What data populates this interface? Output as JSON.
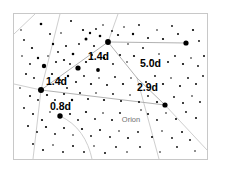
{
  "chart_data": {
    "type": "scatter",
    "title": "",
    "subtitle": "",
    "xlabel": "",
    "ylabel": "",
    "grid": false,
    "legend_position": "none",
    "xlim": [
      13,
      208
    ],
    "ylim": [
      13,
      160
    ],
    "constellation_labels": [
      {
        "name": "orion-label",
        "text": "Orion",
        "x": 131,
        "y": 122,
        "color": "#6f6f6f"
      }
    ],
    "separation_labels": [
      {
        "name": "sep-1-4-upper",
        "text": "1.4d",
        "x": 88,
        "y": 60,
        "color": "#000000"
      },
      {
        "name": "sep-5-0",
        "text": "5.0d",
        "x": 140,
        "y": 67,
        "color": "#000000"
      },
      {
        "name": "sep-1-4-left",
        "text": "1.4d",
        "x": 46,
        "y": 85,
        "color": "#000000"
      },
      {
        "name": "sep-2-9",
        "text": "2.9d",
        "x": 137,
        "y": 91,
        "color": "#000000"
      },
      {
        "name": "sep-0-8",
        "text": "0.8d",
        "x": 50,
        "y": 110,
        "color": "#000000"
      }
    ],
    "bright_stars": [
      {
        "x": 108,
        "y": 42,
        "r": 2.9
      },
      {
        "x": 186,
        "y": 43,
        "r": 2.6
      },
      {
        "x": 41,
        "y": 90,
        "r": 3.0
      },
      {
        "x": 78,
        "y": 68,
        "r": 2.6
      },
      {
        "x": 165,
        "y": 105,
        "r": 2.6
      },
      {
        "x": 60,
        "y": 116,
        "r": 2.7
      },
      {
        "x": 44,
        "y": 66,
        "r": 2.2
      },
      {
        "x": 98,
        "y": 70,
        "r": 1.9
      }
    ],
    "stars": [
      {
        "x": 41,
        "y": 24,
        "r": 1.3
      },
      {
        "x": 61,
        "y": 33,
        "r": 0.8
      },
      {
        "x": 71,
        "y": 21,
        "r": 1.0
      },
      {
        "x": 83,
        "y": 30,
        "r": 1.1
      },
      {
        "x": 86,
        "y": 39,
        "r": 1.5
      },
      {
        "x": 90,
        "y": 33,
        "r": 1.2
      },
      {
        "x": 96,
        "y": 29,
        "r": 0.9
      },
      {
        "x": 100,
        "y": 36,
        "r": 1.3
      },
      {
        "x": 103,
        "y": 25,
        "r": 0.8
      },
      {
        "x": 112,
        "y": 31,
        "r": 0.9
      },
      {
        "x": 118,
        "y": 35,
        "r": 1.1
      },
      {
        "x": 124,
        "y": 27,
        "r": 0.8
      },
      {
        "x": 133,
        "y": 34,
        "r": 1.2
      },
      {
        "x": 139,
        "y": 25,
        "r": 0.9
      },
      {
        "x": 148,
        "y": 38,
        "r": 1.0
      },
      {
        "x": 157,
        "y": 30,
        "r": 0.8
      },
      {
        "x": 163,
        "y": 39,
        "r": 1.1
      },
      {
        "x": 172,
        "y": 26,
        "r": 0.9
      },
      {
        "x": 178,
        "y": 34,
        "r": 1.0
      },
      {
        "x": 193,
        "y": 30,
        "r": 1.1
      },
      {
        "x": 199,
        "y": 41,
        "r": 0.9
      },
      {
        "x": 24,
        "y": 40,
        "r": 0.9
      },
      {
        "x": 32,
        "y": 48,
        "r": 1.1
      },
      {
        "x": 53,
        "y": 44,
        "r": 1.2
      },
      {
        "x": 58,
        "y": 52,
        "r": 0.9
      },
      {
        "x": 66,
        "y": 46,
        "r": 1.0
      },
      {
        "x": 73,
        "y": 54,
        "r": 1.3
      },
      {
        "x": 79,
        "y": 44,
        "r": 0.9
      },
      {
        "x": 64,
        "y": 60,
        "r": 1.1
      },
      {
        "x": 70,
        "y": 64,
        "r": 0.9
      },
      {
        "x": 56,
        "y": 62,
        "r": 1.0
      },
      {
        "x": 48,
        "y": 56,
        "r": 0.8
      },
      {
        "x": 38,
        "y": 58,
        "r": 1.2
      },
      {
        "x": 30,
        "y": 64,
        "r": 0.9
      },
      {
        "x": 22,
        "y": 56,
        "r": 0.8
      },
      {
        "x": 86,
        "y": 62,
        "r": 1.1
      },
      {
        "x": 92,
        "y": 55,
        "r": 0.9
      },
      {
        "x": 104,
        "y": 58,
        "r": 1.2
      },
      {
        "x": 113,
        "y": 64,
        "r": 0.9
      },
      {
        "x": 120,
        "y": 55,
        "r": 1.0
      },
      {
        "x": 127,
        "y": 62,
        "r": 0.8
      },
      {
        "x": 134,
        "y": 56,
        "r": 1.1
      },
      {
        "x": 151,
        "y": 60,
        "r": 0.9
      },
      {
        "x": 159,
        "y": 54,
        "r": 0.8
      },
      {
        "x": 168,
        "y": 62,
        "r": 1.0
      },
      {
        "x": 175,
        "y": 56,
        "r": 0.9
      },
      {
        "x": 183,
        "y": 64,
        "r": 1.1
      },
      {
        "x": 191,
        "y": 58,
        "r": 0.8
      },
      {
        "x": 198,
        "y": 66,
        "r": 0.9
      },
      {
        "x": 204,
        "y": 56,
        "r": 1.0
      },
      {
        "x": 26,
        "y": 74,
        "r": 1.0
      },
      {
        "x": 34,
        "y": 78,
        "r": 0.9
      },
      {
        "x": 52,
        "y": 74,
        "r": 1.1
      },
      {
        "x": 60,
        "y": 80,
        "r": 0.9
      },
      {
        "x": 68,
        "y": 76,
        "r": 1.2
      },
      {
        "x": 76,
        "y": 82,
        "r": 1.0
      },
      {
        "x": 84,
        "y": 76,
        "r": 0.9
      },
      {
        "x": 91,
        "y": 84,
        "r": 1.1
      },
      {
        "x": 99,
        "y": 78,
        "r": 0.8
      },
      {
        "x": 107,
        "y": 85,
        "r": 1.0
      },
      {
        "x": 115,
        "y": 77,
        "r": 0.9
      },
      {
        "x": 123,
        "y": 84,
        "r": 1.1
      },
      {
        "x": 131,
        "y": 78,
        "r": 0.8
      },
      {
        "x": 146,
        "y": 82,
        "r": 1.0
      },
      {
        "x": 155,
        "y": 76,
        "r": 0.9
      },
      {
        "x": 163,
        "y": 84,
        "r": 1.1
      },
      {
        "x": 171,
        "y": 78,
        "r": 0.8
      },
      {
        "x": 180,
        "y": 86,
        "r": 1.0
      },
      {
        "x": 188,
        "y": 78,
        "r": 0.9
      },
      {
        "x": 196,
        "y": 84,
        "r": 1.0
      },
      {
        "x": 203,
        "y": 76,
        "r": 0.9
      },
      {
        "x": 20,
        "y": 88,
        "r": 0.8
      },
      {
        "x": 30,
        "y": 96,
        "r": 1.0
      },
      {
        "x": 38,
        "y": 100,
        "r": 0.9
      },
      {
        "x": 47,
        "y": 95,
        "r": 1.1
      },
      {
        "x": 55,
        "y": 100,
        "r": 0.9
      },
      {
        "x": 64,
        "y": 94,
        "r": 1.0
      },
      {
        "x": 72,
        "y": 100,
        "r": 1.2
      },
      {
        "x": 80,
        "y": 93,
        "r": 0.9
      },
      {
        "x": 88,
        "y": 99,
        "r": 1.0
      },
      {
        "x": 96,
        "y": 93,
        "r": 0.8
      },
      {
        "x": 104,
        "y": 100,
        "r": 1.1
      },
      {
        "x": 113,
        "y": 94,
        "r": 0.9
      },
      {
        "x": 121,
        "y": 101,
        "r": 1.0
      },
      {
        "x": 130,
        "y": 95,
        "r": 0.8
      },
      {
        "x": 139,
        "y": 102,
        "r": 1.0
      },
      {
        "x": 148,
        "y": 96,
        "r": 0.9
      },
      {
        "x": 157,
        "y": 102,
        "r": 1.1
      },
      {
        "x": 174,
        "y": 97,
        "r": 0.9
      },
      {
        "x": 183,
        "y": 103,
        "r": 1.0
      },
      {
        "x": 192,
        "y": 96,
        "r": 0.8
      },
      {
        "x": 200,
        "y": 102,
        "r": 0.9
      },
      {
        "x": 24,
        "y": 108,
        "r": 0.9
      },
      {
        "x": 33,
        "y": 114,
        "r": 1.0
      },
      {
        "x": 42,
        "y": 120,
        "r": 1.1
      },
      {
        "x": 50,
        "y": 112,
        "r": 0.8
      },
      {
        "x": 70,
        "y": 114,
        "r": 1.0
      },
      {
        "x": 78,
        "y": 120,
        "r": 0.9
      },
      {
        "x": 86,
        "y": 112,
        "r": 1.1
      },
      {
        "x": 95,
        "y": 119,
        "r": 0.9
      },
      {
        "x": 103,
        "y": 113,
        "r": 0.8
      },
      {
        "x": 112,
        "y": 120,
        "r": 1.0
      },
      {
        "x": 120,
        "y": 113,
        "r": 0.9
      },
      {
        "x": 148,
        "y": 114,
        "r": 1.0
      },
      {
        "x": 157,
        "y": 120,
        "r": 0.9
      },
      {
        "x": 166,
        "y": 113,
        "r": 0.8
      },
      {
        "x": 176,
        "y": 119,
        "r": 1.0
      },
      {
        "x": 186,
        "y": 112,
        "r": 0.9
      },
      {
        "x": 196,
        "y": 118,
        "r": 1.0
      },
      {
        "x": 28,
        "y": 126,
        "r": 1.0
      },
      {
        "x": 37,
        "y": 132,
        "r": 0.9
      },
      {
        "x": 46,
        "y": 127,
        "r": 1.1
      },
      {
        "x": 55,
        "y": 134,
        "r": 0.9
      },
      {
        "x": 64,
        "y": 128,
        "r": 1.0
      },
      {
        "x": 73,
        "y": 135,
        "r": 0.8
      },
      {
        "x": 82,
        "y": 129,
        "r": 1.1
      },
      {
        "x": 91,
        "y": 136,
        "r": 0.9
      },
      {
        "x": 100,
        "y": 130,
        "r": 1.0
      },
      {
        "x": 110,
        "y": 137,
        "r": 0.9
      },
      {
        "x": 119,
        "y": 131,
        "r": 0.8
      },
      {
        "x": 128,
        "y": 138,
        "r": 1.0
      },
      {
        "x": 138,
        "y": 132,
        "r": 0.9
      },
      {
        "x": 152,
        "y": 137,
        "r": 1.0
      },
      {
        "x": 162,
        "y": 131,
        "r": 0.8
      },
      {
        "x": 172,
        "y": 138,
        "r": 0.9
      },
      {
        "x": 182,
        "y": 132,
        "r": 1.0
      },
      {
        "x": 33,
        "y": 144,
        "r": 0.9
      },
      {
        "x": 43,
        "y": 150,
        "r": 1.0
      },
      {
        "x": 53,
        "y": 145,
        "r": 0.8
      },
      {
        "x": 63,
        "y": 152,
        "r": 0.9
      },
      {
        "x": 73,
        "y": 146,
        "r": 1.0
      },
      {
        "x": 84,
        "y": 152,
        "r": 0.9
      },
      {
        "x": 94,
        "y": 146,
        "r": 0.8
      },
      {
        "x": 105,
        "y": 153,
        "r": 1.0
      },
      {
        "x": 116,
        "y": 147,
        "r": 0.9
      },
      {
        "x": 127,
        "y": 152,
        "r": 0.8
      },
      {
        "x": 140,
        "y": 147,
        "r": 0.9
      },
      {
        "x": 160,
        "y": 152,
        "r": 0.8
      },
      {
        "x": 177,
        "y": 147,
        "r": 0.9
      },
      {
        "x": 195,
        "y": 151,
        "r": 0.8
      },
      {
        "x": 21,
        "y": 30,
        "r": 0.8
      },
      {
        "x": 50,
        "y": 34,
        "r": 0.9
      },
      {
        "x": 128,
        "y": 44,
        "r": 0.8
      },
      {
        "x": 143,
        "y": 48,
        "r": 0.9
      },
      {
        "x": 94,
        "y": 46,
        "r": 1.0
      },
      {
        "x": 67,
        "y": 88,
        "r": 0.9
      },
      {
        "x": 141,
        "y": 110,
        "r": 0.8
      },
      {
        "x": 190,
        "y": 140,
        "r": 0.9
      }
    ],
    "asterism_segments": [
      {
        "x1": 41,
        "y1": 90,
        "x2": 108,
        "y2": 42
      },
      {
        "x1": 41,
        "y1": 90,
        "x2": 165,
        "y2": 105
      },
      {
        "x1": 108,
        "y1": 42,
        "x2": 186,
        "y2": 43
      },
      {
        "x1": 108,
        "y1": 42,
        "x2": 137,
        "y2": 78
      },
      {
        "x1": 137,
        "y1": 78,
        "x2": 165,
        "y2": 105
      }
    ],
    "boundary_paths": [
      "M 14 34 L 35 14",
      "M 14 84 L 41 90",
      "M 41 90 L 60 14",
      "M 41 90 L 33 159",
      "M 108 42 L 118 14",
      "M 137 78 L 159 159",
      "M 60 116 C 78 124 88 140 92 159",
      "M 165 105 L 207 150"
    ]
  },
  "frame": {
    "name": "chart-frame",
    "x": 13,
    "y": 13,
    "width": 195,
    "height": 147,
    "border_color": "#c8c8c8",
    "background": "#ffffff"
  },
  "canvas": {
    "background": "#ffffff",
    "width": 225,
    "height": 172
  }
}
